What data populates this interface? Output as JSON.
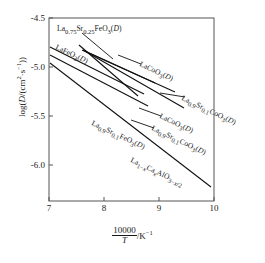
{
  "chart_data": {
    "type": "line",
    "title": "",
    "xlabel": "10000/T /K^-1",
    "ylabel": "log(D/(cm^2*s^-1))",
    "xlim": [
      6.8,
      10.15
    ],
    "ylim": [
      -6.28,
      -4.42
    ],
    "xticks": [
      "7",
      "8",
      "9",
      "10"
    ],
    "xtick_values": [
      7,
      8,
      9,
      10
    ],
    "yticks": [
      "-4.5",
      "-5.0",
      "-5.5",
      "-6.0"
    ],
    "ytick_values": [
      -4.5,
      -5.0,
      -5.5,
      -6.0
    ],
    "grid": false,
    "legend": "inline-annotations",
    "series": [
      {
        "name": "La0.75Sr0.25FeO3(D)",
        "label_html": "La<sub>0.75</sub>Sr<sub>0.25</sub>FeO<sub>3</sub>(<i>D</i>)",
        "x": [
          7.55,
          8.62
        ],
        "y": [
          -4.78,
          -5.3
        ]
      },
      {
        "name": "LaFeO3(D)",
        "label_html": "LaFeO<sub>3</sub>(<i>D</i>)",
        "x": [
          7.02,
          8.72
        ],
        "y": [
          -4.8,
          -5.28
        ]
      },
      {
        "name": "LaCoO3(D)-upper",
        "label_html": "LaCoO<sub>3</sub>(<i>D</i>)",
        "x": [
          7.66,
          8.92
        ],
        "y": [
          -4.84,
          -5.17
        ]
      },
      {
        "name": "La0.9Sr0.1CoO3(D)-upper",
        "label_html": "La<sub>0.9</sub>Sr<sub>0.1</sub>CoO<sub>3</sub>(<i>D</i>)",
        "x": [
          7.6,
          9.28
        ],
        "y": [
          -4.83,
          -5.26
        ]
      },
      {
        "name": "LaCoO3(D)-lower",
        "label_html": "LaCoO<sub>3</sub>(<i>D</i>)",
        "x": [
          7.62,
          9.45
        ],
        "y": [
          -4.83,
          -5.42
        ]
      },
      {
        "name": "La0.9Sr0.1FeO3(D)",
        "label_html": "La<sub>0.9</sub>Sr<sub>0.1</sub>FeO<sub>3</sub>(<i>D</i>)",
        "x": [
          7.02,
          8.8
        ],
        "y": [
          -4.88,
          -5.4
        ]
      },
      {
        "name": "La1-xCaxAlO3-x/2",
        "label_html": "La<sub>1&minus;<i>x</i></sub>Ca<sub><i>x</i></sub>AlO<sub>3&minus;<i>x</i>/2</sub>",
        "x": [
          7.02,
          9.95
        ],
        "y": [
          -4.96,
          -6.23
        ]
      }
    ],
    "annotations": [
      {
        "id": "ann-la075sr025feo3",
        "text_html": "La<sub>0.75</sub>Sr<sub>0.25</sub>FeO<sub>3</sub>(<i>D</i>)",
        "x": 57,
        "y": 24,
        "rotation": 0
      },
      {
        "id": "ann-lafeo3",
        "text_html": "LaFeO<sub>3</sub>(<i>D</i>)",
        "x": 56,
        "y": 42,
        "rotation": 25
      },
      {
        "id": "ann-lacoo3-upper",
        "text_html": "LaCoO<sub>3</sub>(<i>D</i>)",
        "x": 140,
        "y": 59,
        "rotation": 25
      },
      {
        "id": "ann-la09sr01coo3-upper",
        "text_html": "La<sub>0.9</sub>Sr<sub>0.1</sub>CoO<sub>3</sub>(<i>D</i>)",
        "x": 182,
        "y": 93,
        "rotation": 25
      },
      {
        "id": "ann-lacoo3-lower",
        "text_html": "LaCoO<sub>3</sub>(<i>D</i>)",
        "x": 160,
        "y": 111,
        "rotation": 25
      },
      {
        "id": "ann-la09sr01coo3-lower",
        "text_html": "La<sub>0.9</sub>Sr<sub>0.1</sub>CoO<sub>3</sub>(<i>D</i>)",
        "x": 152,
        "y": 123,
        "rotation": 25
      },
      {
        "id": "ann-la09sr01feo3",
        "text_html": "La<sub>0.9</sub>Sr<sub>0.1</sub>FeO<sub>3</sub>(<i>D</i>)",
        "x": 92,
        "y": 118,
        "rotation": 25
      },
      {
        "id": "ann-la1xcaxalo3",
        "text_html": "La<sub>1&minus;<i>x</i></sub>Ca<sub><i>x</i></sub>AlO<sub>3&minus;<i>x</i>/2</sub>",
        "x": 131,
        "y": 155,
        "rotation": 25
      }
    ],
    "leader_lines": [
      {
        "id": "leader-la075sr025feo3",
        "x1": 82,
        "y1": 33,
        "x2": 113,
        "y2": 59
      },
      {
        "id": "leader-lacoo3-upper",
        "x1": 141,
        "y1": 64,
        "x2": 118,
        "y2": 55
      },
      {
        "id": "leader-la09sr01coo3-upper",
        "x1": 185,
        "y1": 97,
        "x2": 160,
        "y2": 93
      },
      {
        "id": "leader-lacoo3-lower",
        "x1": 161,
        "y1": 116,
        "x2": 139,
        "y2": 108
      },
      {
        "id": "leader-la09sr01coo3-lower",
        "x1": 154,
        "y1": 128,
        "x2": 131,
        "y2": 120
      }
    ],
    "axis": {
      "left_px": 49,
      "right_px": 214,
      "top_px": 18,
      "bottom_px": 201,
      "color": "#000000",
      "line_color": "#111111"
    }
  }
}
